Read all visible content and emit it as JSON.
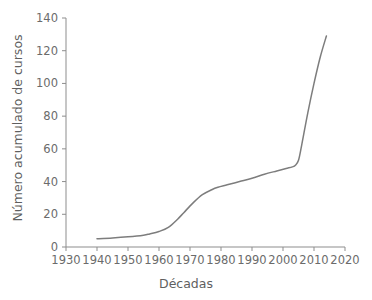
{
  "chart_data": {
    "type": "line",
    "title": "",
    "xlabel": "Décadas",
    "ylabel": "Número acumulado de cursos",
    "xlim": [
      1930,
      2020
    ],
    "ylim": [
      0,
      140
    ],
    "grid": false,
    "legend": null,
    "xticks": [
      "1930",
      "1940",
      "1950",
      "1960",
      "1970",
      "1980",
      "1990",
      "2000",
      "2010",
      "2020"
    ],
    "yticks": [
      "0",
      "20",
      "40",
      "60",
      "80",
      "100",
      "120",
      "140"
    ],
    "line_color": "#7d7d7d",
    "axis_color": "#8d8d8d",
    "background_color": "#ffffff",
    "series": [
      {
        "name": "Número acumulado de cursos",
        "x": [
          1940,
          1945,
          1950,
          1955,
          1957,
          1960,
          1963,
          1966,
          1968,
          1971,
          1974,
          1977,
          1979,
          1982,
          1986,
          1990,
          1994,
          1998,
          2001,
          2003,
          2004,
          2005,
          2006,
          2008,
          2010,
          2012,
          2014
        ],
        "values": [
          5,
          5.5,
          6.2,
          7.2,
          8,
          9.5,
          12,
          17,
          21,
          27,
          32,
          35,
          36.5,
          38,
          40,
          42,
          44.5,
          46.5,
          48,
          49,
          50,
          53,
          62,
          82,
          100,
          116,
          129
        ]
      }
    ]
  }
}
